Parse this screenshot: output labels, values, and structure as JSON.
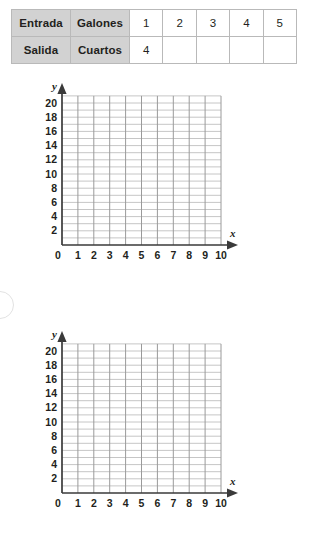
{
  "table": {
    "rows": [
      {
        "label": "Entrada",
        "unit": "Galones",
        "values": [
          "1",
          "2",
          "3",
          "4",
          "5"
        ]
      },
      {
        "label": "Salida",
        "unit": "Cuartos",
        "values": [
          "4",
          "",
          "",
          "",
          ""
        ]
      }
    ],
    "header_fill": "#d2d2d2",
    "border_color": "#b9b9b9"
  },
  "graphs": [
    {
      "name": "graph-1",
      "x_axis_label": "x",
      "y_axis_label": "y",
      "origin_label": "0",
      "x_ticks": [
        "1",
        "2",
        "3",
        "4",
        "5",
        "6",
        "7",
        "8",
        "9",
        "10"
      ],
      "y_ticks": [
        "2",
        "4",
        "6",
        "8",
        "10",
        "12",
        "14",
        "16",
        "18",
        "20"
      ],
      "x_min": 0,
      "x_max": 10,
      "y_min": 0,
      "y_max": 21,
      "grid": true,
      "plotted_points": []
    },
    {
      "name": "graph-2",
      "x_axis_label": "x",
      "y_axis_label": "y",
      "origin_label": "0",
      "x_ticks": [
        "1",
        "2",
        "3",
        "4",
        "5",
        "6",
        "7",
        "8",
        "9",
        "10"
      ],
      "y_ticks": [
        "2",
        "4",
        "6",
        "8",
        "10",
        "12",
        "14",
        "16",
        "18",
        "20"
      ],
      "x_min": 0,
      "x_max": 10,
      "y_min": 0,
      "y_max": 21,
      "grid": true,
      "plotted_points": []
    }
  ],
  "colors": {
    "ink": "#231f20",
    "grid_vertical": "#9a9a9a",
    "grid_horizontal": "#c6c6c6",
    "axis": "#3a3a3a",
    "page_bubble": "#e2e2e2"
  }
}
